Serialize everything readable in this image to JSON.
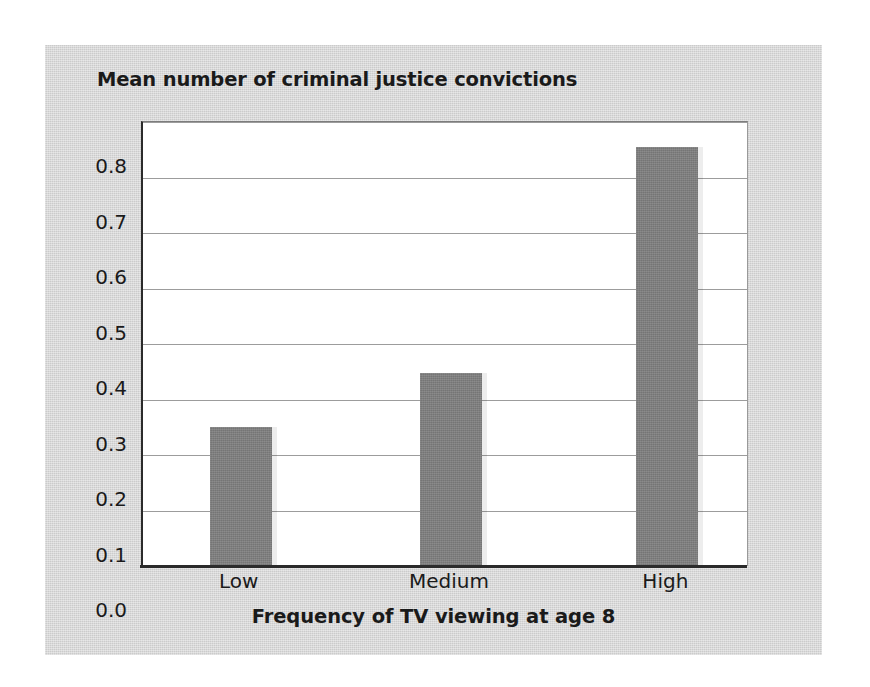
{
  "chart_data": {
    "type": "bar",
    "title": "Mean number of criminal justice convictions",
    "xlabel": "Frequency of TV viewing at age 8",
    "ylabel": "Mean number of criminal justice convictions",
    "categories": [
      "Low",
      "Medium",
      "High"
    ],
    "values": [
      0.25,
      0.347,
      0.755
    ],
    "ylim": [
      0.0,
      0.8
    ],
    "ytick_labels": [
      "0.0",
      "0.1",
      "0.2",
      "0.3",
      "0.4",
      "0.5",
      "0.6",
      "0.7",
      "0.8"
    ],
    "ytick_values": [
      0.0,
      0.1,
      0.2,
      0.3,
      0.4,
      0.5,
      0.6,
      0.7,
      0.8
    ],
    "grid": true,
    "legend": null,
    "series": [
      {
        "name": "Mean number of criminal justice convictions",
        "values": [
          0.25,
          0.347,
          0.755
        ]
      }
    ]
  },
  "colors": {
    "bar_fill": "#808080",
    "panel_background": "#d4d4d4",
    "plot_background": "#ffffff",
    "gridline": "#9c9c9c",
    "axis_line": "#2b2b2b",
    "text": "#1a1a1a"
  }
}
